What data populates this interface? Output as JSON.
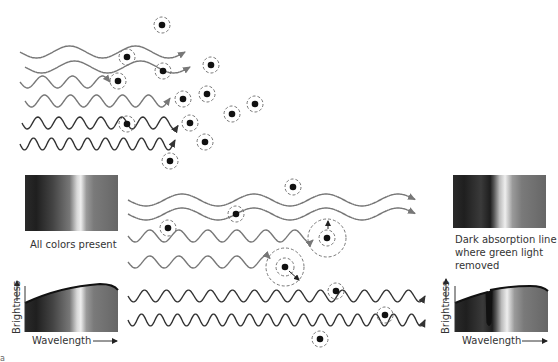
{
  "labels": {
    "left_spectrum_caption": "All colors present",
    "right_spectrum_caption_line1": "Dark absorption line",
    "right_spectrum_caption_line2": "where green light",
    "right_spectrum_caption_line3": "removed",
    "left_graph_ylabel": "Brightness",
    "left_graph_xlabel": "Wavelength",
    "right_graph_ylabel": "Brightness",
    "right_graph_xlabel": "Wavelength",
    "panel_letter": "a"
  },
  "colors": {
    "wave_light": "#777777",
    "wave_dark": "#333333",
    "atom": "#111111",
    "dashed_ring": "#777777"
  },
  "top_panel": {
    "description": "Light waves of various wavelengths encountering atoms",
    "waves": [
      {
        "y": 52,
        "x0": 20,
        "x1": 185,
        "period": 66,
        "amp": 6,
        "color": "light"
      },
      {
        "y": 67,
        "x0": 25,
        "x1": 190,
        "period": 66,
        "amp": 6,
        "color": "light"
      },
      {
        "y": 82,
        "x0": 20,
        "x1": 110,
        "period": 30,
        "amp": 6,
        "color": "light"
      },
      {
        "y": 101,
        "x0": 25,
        "x1": 170,
        "period": 26,
        "amp": 6,
        "color": "light"
      },
      {
        "y": 123,
        "x0": 22,
        "x1": 178,
        "period": 21,
        "amp": 6,
        "color": "dark"
      },
      {
        "y": 144,
        "x0": 20,
        "x1": 175,
        "period": 18,
        "amp": 6,
        "color": "dark"
      }
    ],
    "atoms": [
      {
        "x": 162,
        "y": 25,
        "r": 8
      },
      {
        "x": 127,
        "y": 57,
        "r": 8
      },
      {
        "x": 163,
        "y": 71,
        "r": 8
      },
      {
        "x": 211,
        "y": 65,
        "r": 8
      },
      {
        "x": 118,
        "y": 81,
        "r": 8
      },
      {
        "x": 183,
        "y": 99,
        "r": 8
      },
      {
        "x": 207,
        "y": 94,
        "r": 8
      },
      {
        "x": 255,
        "y": 104,
        "r": 8
      },
      {
        "x": 232,
        "y": 114,
        "r": 8
      },
      {
        "x": 127,
        "y": 124,
        "r": 8
      },
      {
        "x": 190,
        "y": 123,
        "r": 8
      },
      {
        "x": 205,
        "y": 142,
        "r": 8
      },
      {
        "x": 170,
        "y": 161,
        "r": 8
      }
    ]
  },
  "bottom_panel": {
    "waves": [
      {
        "y": 200,
        "x0": 128,
        "x1": 415,
        "period": 72,
        "amp": 6,
        "color": "light"
      },
      {
        "y": 214,
        "x0": 128,
        "x1": 415,
        "period": 72,
        "amp": 6,
        "color": "light"
      },
      {
        "y": 236,
        "x0": 128,
        "x1": 313,
        "period": 29,
        "amp": 6,
        "color": "light"
      },
      {
        "y": 262,
        "x0": 128,
        "x1": 270,
        "period": 29,
        "amp": 6,
        "color": "light"
      },
      {
        "y": 296,
        "x0": 128,
        "x1": 425,
        "period": 22,
        "amp": 6,
        "color": "dark"
      },
      {
        "y": 320,
        "x0": 128,
        "x1": 425,
        "period": 18,
        "amp": 6,
        "color": "dark"
      }
    ],
    "atoms": [
      {
        "x": 293,
        "y": 187,
        "r": 8
      },
      {
        "x": 236,
        "y": 214,
        "r": 8
      },
      {
        "x": 168,
        "y": 228,
        "r": 8
      },
      {
        "x": 327,
        "y": 238,
        "r": 8,
        "excited": true,
        "outer": 19
      },
      {
        "x": 285,
        "y": 267,
        "r": 9,
        "excited": true,
        "outer": 19
      },
      {
        "x": 336,
        "y": 291,
        "r": 8
      },
      {
        "x": 385,
        "y": 315,
        "r": 8
      },
      {
        "x": 320,
        "y": 339,
        "r": 8
      }
    ]
  }
}
